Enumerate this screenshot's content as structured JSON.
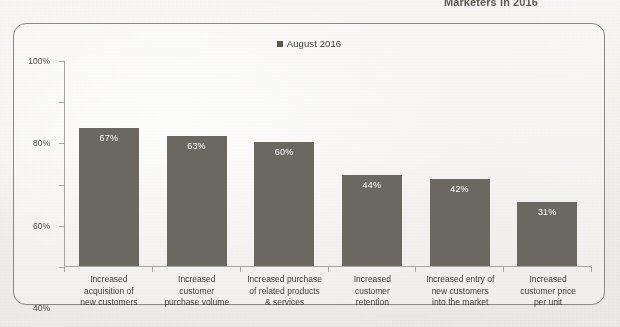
{
  "caption": {
    "text": "Marketers in 2016"
  },
  "chart_data": {
    "type": "bar",
    "title": "",
    "subtitle": "",
    "xlabel": "",
    "ylabel": "",
    "ylim": [
      0,
      100
    ],
    "ytick_labels": [
      "100%",
      "80%",
      "60%",
      "40%",
      "20%",
      "0%"
    ],
    "ytick_values": [
      100,
      80,
      60,
      40,
      20,
      0
    ],
    "grid": false,
    "legend_position": "top-center",
    "legend": [
      "August 2016"
    ],
    "bar_color": "#6b6862",
    "value_label_color": "#ffffff",
    "axis_color": "#a7a5a1",
    "categories": [
      "Increased acquisition of new customers",
      "Increased customer purchase volume",
      "Increased purchase of related products & services",
      "Increased customer retention",
      "Increased entry of new customers into the market",
      "Increased customer price per unit"
    ],
    "category_lines": [
      [
        "Increased",
        "acquisition of",
        "new customers"
      ],
      [
        "Increased",
        "customer",
        "purchase volume"
      ],
      [
        "Increased purchase",
        "of related products",
        "& services"
      ],
      [
        "Increased",
        "customer",
        "retention"
      ],
      [
        "Increased entry of",
        "new customers",
        "into the market"
      ],
      [
        "Increased",
        "customer price",
        "per unit"
      ]
    ],
    "series": [
      {
        "name": "August 2016",
        "values": [
          67,
          63,
          60,
          44,
          42,
          31
        ],
        "value_labels": [
          "67%",
          "63%",
          "60%",
          "44%",
          "42%",
          "31%"
        ]
      }
    ]
  }
}
